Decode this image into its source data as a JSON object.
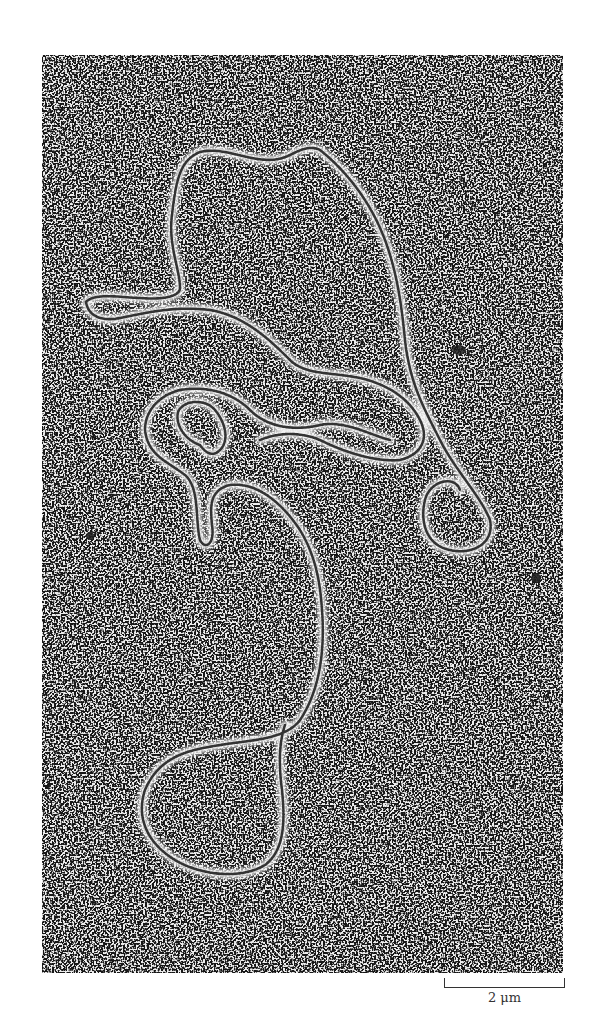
{
  "figure": {
    "type": "electron micrograph",
    "scale_bar": {
      "label": "2 μm"
    }
  }
}
